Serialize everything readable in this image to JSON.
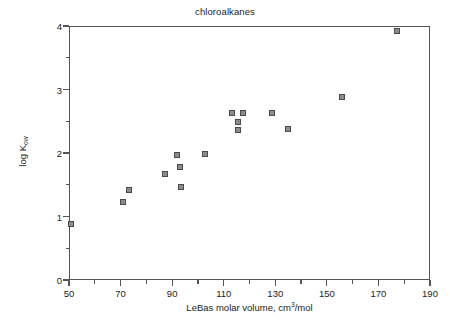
{
  "chart_data": {
    "type": "scatter",
    "title": "chloroalkanes",
    "xlabel_prefix": "LeBas molar volume, cm",
    "xlabel_sup": "3",
    "xlabel_suffix": "/mol",
    "xlabel": "LeBas molar volume, cm3/mol",
    "ylabel_prefix": "log K",
    "ylabel_sub": "ow",
    "ylabel": "log Kow",
    "xlim": [
      50,
      190
    ],
    "ylim": [
      0,
      4
    ],
    "xticks": [
      50,
      70,
      90,
      110,
      130,
      150,
      170,
      190
    ],
    "xticklabels": [
      "50",
      "70",
      "90",
      "110",
      "130",
      "150",
      "170",
      "190"
    ],
    "xminorticks": [
      60,
      80,
      100,
      120,
      140,
      160,
      180
    ],
    "yticks": [
      0,
      1,
      2,
      3,
      4
    ],
    "yticklabels": [
      "0",
      "1",
      "2",
      "3",
      "4"
    ],
    "yminorticks": [
      0.5,
      1.5,
      2.5,
      3.5
    ],
    "grid": false,
    "legend": null,
    "marker": "square",
    "marker_face_color": "#8c8c8c",
    "marker_edge_color": "#4a4a4a",
    "axis_color": "#555555",
    "background": "#ffffff",
    "x": [
      50.5,
      70.5,
      73.0,
      87.0,
      91.5,
      92.5,
      93.0,
      102.5,
      113.0,
      115.0,
      115.0,
      117.0,
      128.5,
      134.5,
      155.5,
      177.0
    ],
    "y": [
      0.9,
      1.25,
      1.44,
      1.69,
      1.98,
      1.79,
      1.48,
      2.0,
      2.65,
      2.5,
      2.38,
      2.65,
      2.64,
      2.39,
      2.9,
      3.93
    ],
    "points": [
      {
        "x": 50.5,
        "y": 0.9
      },
      {
        "x": 70.5,
        "y": 1.25
      },
      {
        "x": 73.0,
        "y": 1.44
      },
      {
        "x": 87.0,
        "y": 1.69
      },
      {
        "x": 91.5,
        "y": 1.98
      },
      {
        "x": 92.5,
        "y": 1.79
      },
      {
        "x": 93.0,
        "y": 1.48
      },
      {
        "x": 102.5,
        "y": 2.0
      },
      {
        "x": 113.0,
        "y": 2.65
      },
      {
        "x": 115.0,
        "y": 2.5
      },
      {
        "x": 115.0,
        "y": 2.38
      },
      {
        "x": 117.0,
        "y": 2.65
      },
      {
        "x": 128.5,
        "y": 2.64
      },
      {
        "x": 134.5,
        "y": 2.39
      },
      {
        "x": 155.5,
        "y": 2.9
      },
      {
        "x": 177.0,
        "y": 3.93
      }
    ]
  }
}
